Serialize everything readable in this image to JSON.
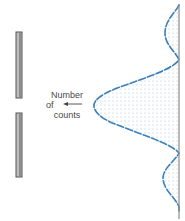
{
  "diagram": {
    "annotation": {
      "line1": "Number",
      "line2": "of",
      "line3": "counts"
    },
    "colors": {
      "curve": "#3a7fb5",
      "fill_dots": "#9bbcd6",
      "slit": "#9a9a9a",
      "slit_edge": "#555555",
      "screen": "#8a8a8a",
      "text": "#4a4a4a"
    },
    "elements": [
      "barrier-with-slit",
      "detection-screen",
      "intensity-curve",
      "pointer-arrow"
    ]
  }
}
